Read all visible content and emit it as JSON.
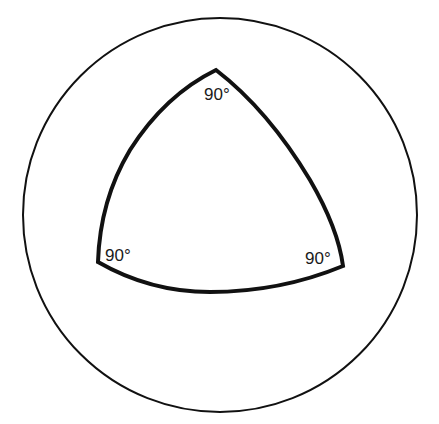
{
  "diagram": {
    "colors": {
      "background": "#ffffff",
      "stroke": "#111111",
      "text": "#1a1a1a"
    },
    "sphere": {
      "cx": 220,
      "cy": 215,
      "r": 197
    },
    "triangle": {
      "vertices": {
        "top": [
          216,
          70
        ],
        "left": [
          98,
          262
        ],
        "right": [
          343,
          266
        ]
      }
    },
    "labels": {
      "top": "90°",
      "left": "90°",
      "right": "90°"
    }
  }
}
